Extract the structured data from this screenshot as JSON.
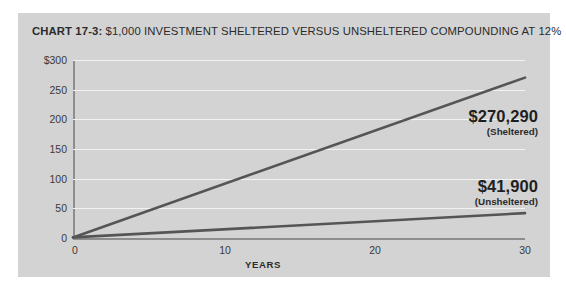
{
  "card": {
    "background": "#d3d3d3"
  },
  "title": {
    "prefix": "CHART 17-3:",
    "text": " $1,000 INVESTMENT SHELTERED VERSUS UNSHELTERED COMPOUNDING AT 12%",
    "full": "CHART 17-3: $1,000 INVESTMENT SHELTERED VERSUS UNSHELTERED COMPOUNDING AT 12%"
  },
  "chart_data": {
    "type": "line",
    "title": "CHART 17-3: $1,000 INVESTMENT SHELTERED VERSUS UNSHELTERED COMPOUNDING AT 12%",
    "xlabel": "YEARS",
    "ylabel": "",
    "xlim": [
      0,
      30
    ],
    "ylim": [
      0,
      300
    ],
    "xticks": [
      "0",
      "10",
      "20",
      "30"
    ],
    "xtick_values": [
      0,
      10,
      20,
      30
    ],
    "yticks": [
      "$300",
      "250",
      "200",
      "150",
      "100",
      "50",
      "0"
    ],
    "ytick_values": [
      300,
      250,
      200,
      150,
      100,
      50,
      0
    ],
    "y_units": "thousands of dollars",
    "grid": "horizontal",
    "legend": "none",
    "line_color": "#555555",
    "gridline_color": "#f2f2f2",
    "axis_color": "#8d8d8d",
    "series": [
      {
        "name": "Sheltered",
        "x": [
          0,
          30
        ],
        "values": [
          1,
          270.29
        ],
        "end_label": "$270,290",
        "end_sub": "(Sheltered)"
      },
      {
        "name": "Unsheltered",
        "x": [
          0,
          30
        ],
        "values": [
          1,
          41.9
        ],
        "end_label": "$41,900",
        "end_sub": "(Unsheltered)"
      }
    ],
    "annotations": [
      {
        "value": "$270,290",
        "label": "(Sheltered)"
      },
      {
        "value": "$41,900",
        "label": "(Unsheltered)"
      }
    ]
  }
}
